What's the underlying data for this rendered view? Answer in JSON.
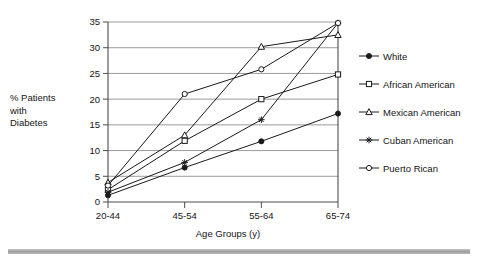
{
  "chart_data": {
    "type": "line",
    "title": "",
    "xlabel": "Age Groups (y)",
    "ylabel": "% Patients with Diabetes",
    "ylabel_lines": [
      "% Patients",
      "with",
      "Diabetes"
    ],
    "categories": [
      "20-44",
      "45-54",
      "55-64",
      "65-74"
    ],
    "ylim": [
      0,
      35
    ],
    "yticks": [
      0,
      5,
      10,
      15,
      20,
      25,
      30,
      35
    ],
    "ytick_labels": [
      "0",
      "5",
      "10",
      "15",
      "20",
      "25",
      "30",
      "35"
    ],
    "grid": "horizontal",
    "legend_position": "right",
    "series": [
      {
        "name": "White",
        "marker": "filled-circle",
        "color": "#1a1a1a",
        "values": [
          1.3,
          6.7,
          11.8,
          17.2
        ]
      },
      {
        "name": "African American",
        "marker": "open-square",
        "color": "#1a1a1a",
        "values": [
          2.4,
          11.9,
          20.0,
          24.8
        ]
      },
      {
        "name": "Mexican American",
        "marker": "open-triangle",
        "color": "#1a1a1a",
        "values": [
          3.8,
          13.0,
          30.2,
          32.5
        ]
      },
      {
        "name": "Cuban American",
        "marker": "asterisk",
        "color": "#1a1a1a",
        "values": [
          1.9,
          7.7,
          16.0,
          34.8
        ]
      },
      {
        "name": "Puerto Rican",
        "marker": "open-circle",
        "color": "#1a1a1a",
        "values": [
          3.2,
          21.0,
          25.8,
          34.8
        ]
      }
    ]
  },
  "legend": {
    "items": [
      {
        "label": "White"
      },
      {
        "label": "African American"
      },
      {
        "label": "Mexican American"
      },
      {
        "label": "Cuban American"
      },
      {
        "label": "Puerto Rican"
      }
    ]
  },
  "axes": {
    "y_label_line1": "% Patients",
    "y_label_line2": "with",
    "y_label_line3": "Diabetes",
    "x_title": "Age Groups (y)"
  },
  "colors": {
    "ink": "#1a1a1a",
    "grid": "#808080",
    "axis": "#4d4d4d",
    "footer_rule": "#9a9a9a"
  }
}
